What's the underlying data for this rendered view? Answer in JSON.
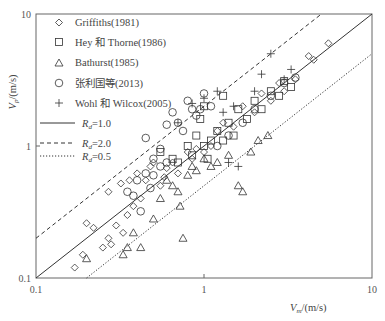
{
  "chart_data": {
    "type": "scatter",
    "title": "",
    "xlabel": "V_m /(m/s)",
    "ylabel": "V_p /(m/s)",
    "xscale": "log",
    "yscale": "log",
    "xlim": [
      0.1,
      10
    ],
    "ylim": [
      0.1,
      10
    ],
    "x_ticks": [
      "0.1",
      "1",
      "10"
    ],
    "y_ticks": [
      "0.1",
      "1",
      "10"
    ],
    "grid": false,
    "legend_position": "upper-left",
    "reference_lines": [
      {
        "label": "R_d=1.0",
        "ratio": 1.0,
        "style": "solid"
      },
      {
        "label": "R_d=2.0",
        "ratio": 2.0,
        "style": "dashed"
      },
      {
        "label": "R_d=0.5",
        "ratio": 0.5,
        "style": "dotted"
      }
    ],
    "series": [
      {
        "name": "Griffiths(1981)",
        "marker": "diamond",
        "points": [
          [
            0.17,
            0.12
          ],
          [
            0.19,
            0.15
          ],
          [
            0.2,
            0.26
          ],
          [
            0.22,
            0.24
          ],
          [
            0.25,
            0.17
          ],
          [
            0.27,
            0.2
          ],
          [
            0.28,
            0.18
          ],
          [
            0.3,
            0.25
          ],
          [
            0.32,
            0.52
          ],
          [
            0.33,
            0.22
          ],
          [
            0.35,
            0.3
          ],
          [
            0.36,
            0.55
          ],
          [
            0.38,
            0.35
          ],
          [
            0.4,
            0.62
          ],
          [
            0.42,
            0.4
          ],
          [
            0.45,
            0.55
          ],
          [
            0.48,
            0.7
          ],
          [
            0.5,
            0.75
          ],
          [
            0.55,
            0.5
          ],
          [
            0.6,
            0.68
          ],
          [
            0.65,
            0.75
          ],
          [
            0.7,
            0.62
          ],
          [
            0.8,
            0.9
          ],
          [
            0.85,
            0.8
          ],
          [
            0.9,
            0.95
          ],
          [
            1.0,
            0.9
          ],
          [
            1.1,
            1.0
          ],
          [
            1.2,
            1.3
          ],
          [
            1.3,
            1.5
          ],
          [
            1.5,
            1.4
          ],
          [
            1.7,
            2.0
          ],
          [
            2.0,
            1.8
          ],
          [
            2.2,
            2.5
          ],
          [
            2.5,
            2.2
          ],
          [
            2.8,
            3.0
          ],
          [
            3.0,
            2.6
          ],
          [
            3.5,
            3.2
          ],
          [
            4.2,
            4.8
          ],
          [
            4.5,
            4.5
          ],
          [
            5.5,
            6.0
          ],
          [
            0.27,
            0.45
          ],
          [
            0.58,
            0.58
          ]
        ]
      },
      {
        "name": "Hey 和 Thorne(1986)",
        "marker": "square",
        "points": [
          [
            0.55,
            0.9
          ],
          [
            0.65,
            0.8
          ],
          [
            0.7,
            0.75
          ],
          [
            0.8,
            1.0
          ],
          [
            0.85,
            0.85
          ],
          [
            0.9,
            1.2
          ],
          [
            1.0,
            1.0
          ],
          [
            1.05,
            0.8
          ],
          [
            1.1,
            1.1
          ],
          [
            1.2,
            1.3
          ],
          [
            1.3,
            1.1
          ],
          [
            1.4,
            1.5
          ],
          [
            1.5,
            1.2
          ],
          [
            1.6,
            1.9
          ],
          [
            1.8,
            1.6
          ],
          [
            2.0,
            2.2
          ],
          [
            2.2,
            1.9
          ],
          [
            2.5,
            2.6
          ],
          [
            2.8,
            2.4
          ],
          [
            3.0,
            3.1
          ],
          [
            3.3,
            2.8
          ],
          [
            1.0,
            2.0
          ],
          [
            0.95,
            1.6
          ],
          [
            1.3,
            2.4
          ]
        ]
      },
      {
        "name": "Bathurst(1985)",
        "marker": "triangle",
        "points": [
          [
            0.2,
            0.14
          ],
          [
            0.33,
            0.15
          ],
          [
            0.35,
            0.17
          ],
          [
            0.38,
            0.22
          ],
          [
            0.42,
            0.17
          ],
          [
            0.5,
            0.28
          ],
          [
            0.55,
            0.4
          ],
          [
            0.6,
            0.55
          ],
          [
            0.65,
            0.5
          ],
          [
            0.7,
            0.45
          ],
          [
            0.72,
            0.35
          ],
          [
            0.75,
            0.2
          ],
          [
            0.8,
            0.6
          ],
          [
            0.85,
            0.7
          ],
          [
            0.9,
            0.65
          ],
          [
            1.0,
            0.8
          ],
          [
            1.1,
            0.7
          ],
          [
            1.2,
            0.75
          ],
          [
            1.4,
            0.85
          ],
          [
            1.6,
            0.5
          ],
          [
            1.7,
            0.45
          ],
          [
            1.9,
            0.9
          ],
          [
            2.1,
            1.1
          ],
          [
            2.4,
            1.2
          ]
        ]
      },
      {
        "name": "张利国等(2013)",
        "marker": "circle",
        "points": [
          [
            0.45,
            1.15
          ],
          [
            0.5,
            0.8
          ],
          [
            0.55,
            0.95
          ],
          [
            0.6,
            1.45
          ],
          [
            0.65,
            1.8
          ],
          [
            0.7,
            1.5
          ],
          [
            0.75,
            1.3
          ],
          [
            0.8,
            2.2
          ],
          [
            0.85,
            1.9
          ],
          [
            0.9,
            1.7
          ],
          [
            0.95,
            1.9
          ],
          [
            1.0,
            2.5
          ],
          [
            1.1,
            2.0
          ],
          [
            0.4,
            0.55
          ],
          [
            0.45,
            0.62
          ],
          [
            0.35,
            0.45
          ],
          [
            0.38,
            0.42
          ],
          [
            0.42,
            0.32
          ],
          [
            0.5,
            0.6
          ],
          [
            0.55,
            0.7
          ],
          [
            0.6,
            0.75
          ],
          [
            1.2,
            1.0
          ],
          [
            1.4,
            1.2
          ],
          [
            1.7,
            1.5
          ],
          [
            2.0,
            1.9
          ],
          [
            2.5,
            2.4
          ],
          [
            3.0,
            3.0
          ],
          [
            3.5,
            3.3
          ],
          [
            0.48,
            0.48
          ]
        ]
      },
      {
        "name": "Wohl 和 Wilcox(2005)",
        "marker": "plus",
        "points": [
          [
            0.7,
            1.5
          ],
          [
            0.85,
            2.1
          ],
          [
            1.0,
            2.3
          ],
          [
            1.2,
            2.6
          ],
          [
            1.3,
            1.8
          ],
          [
            1.5,
            2.0
          ],
          [
            2.2,
            3.5
          ],
          [
            2.5,
            5.0
          ],
          [
            3.0,
            3.2
          ],
          [
            3.3,
            3.8
          ],
          [
            1.6,
            0.7
          ],
          [
            1.4,
            0.75
          ],
          [
            2.0,
            2.6
          ]
        ]
      }
    ]
  },
  "legend": {
    "items": [
      {
        "symbol": "◇",
        "label": "Griffiths(1981)"
      },
      {
        "symbol": "□",
        "label": "Hey 和 Thorne(1986)"
      },
      {
        "symbol": "△",
        "label": "Bathurst(1985)"
      },
      {
        "symbol": "○",
        "label": "张利国等(2013)"
      },
      {
        "symbol": "+",
        "label": "Wohl 和 Wilcox(2005)"
      }
    ],
    "lines": [
      {
        "style": "solid",
        "var": "R",
        "sub": "d",
        "value": "=1.0"
      },
      {
        "style": "dashed",
        "var": "R",
        "sub": "d",
        "value": "=2.0"
      },
      {
        "style": "dotted",
        "var": "R",
        "sub": "d",
        "value": "=0.5"
      }
    ]
  },
  "axes": {
    "x_ticks": [
      "0.1",
      "1",
      "10"
    ],
    "y_ticks": [
      "10",
      "1",
      "0.1"
    ],
    "xlabel_var": "V",
    "xlabel_sub": "m",
    "xlabel_unit": "/(m/s)",
    "ylabel_var": "V",
    "ylabel_sub": "p",
    "ylabel_unit": "/(m/s)"
  }
}
